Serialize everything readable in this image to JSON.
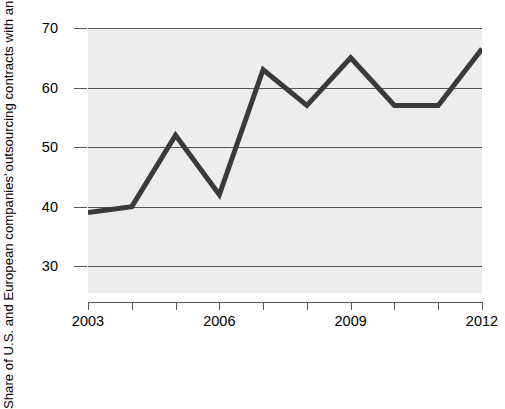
{
  "chart_data": {
    "type": "line",
    "title": "",
    "xlabel": "",
    "ylabel_line1": "Share of U.S. and European companies'",
    "ylabel_line2": "outsourcing contracts with an offshore element",
    "x": [
      2003,
      2004,
      2005,
      2006,
      2007,
      2008,
      2009,
      2010,
      2011,
      2012
    ],
    "values": [
      39,
      40,
      52,
      42,
      63,
      57,
      65,
      57,
      57,
      66.5
    ],
    "series": [
      {
        "name": "Share with offshore element",
        "values": [
          39,
          40,
          52,
          42,
          63,
          57,
          65,
          57,
          57,
          66.5
        ]
      }
    ],
    "xtick_labels": [
      "2003",
      "2006",
      "2009",
      "2012"
    ],
    "xtick_label_years": [
      2003,
      2006,
      2009,
      2012
    ],
    "xtick_all_years": [
      2003,
      2004,
      2005,
      2006,
      2007,
      2008,
      2009,
      2010,
      2011,
      2012
    ],
    "ytick_labels": [
      "30",
      "40",
      "50",
      "60",
      "70"
    ],
    "ytick_values": [
      30,
      40,
      50,
      60,
      70
    ],
    "xlim": [
      2003,
      2012
    ],
    "ylim": [
      25.5,
      70
    ],
    "grid": true,
    "grid_axis": "y",
    "legend": "none",
    "line_color": "#3a3a3a",
    "line_width": 5,
    "plot_background": "#ededed",
    "figure_background": "#ffffff",
    "axis_color": "#555555"
  }
}
